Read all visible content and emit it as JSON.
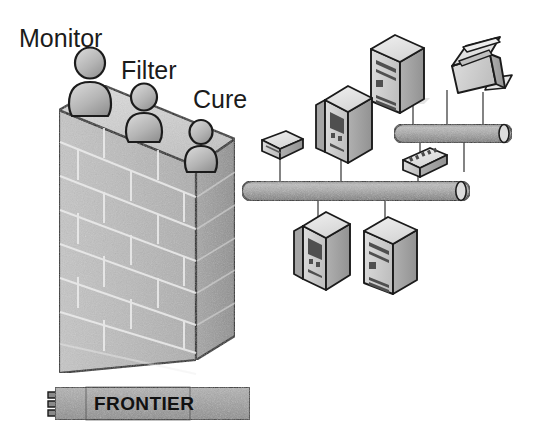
{
  "diagram": {
    "background_color": "#ffffff",
    "ink_color": "#1b1b1b"
  },
  "firewall": {
    "name": "brick-firewall",
    "brick_courses": 6,
    "face_color": "#b9b9b9",
    "top_color": "#d2d2d2",
    "side_color": "#9a9a9a",
    "mortar_color": "#e8e8e8",
    "outline_color": "#1b1b1b"
  },
  "guards": [
    {
      "label": "Monitor",
      "figure": "person-figure",
      "size": "large"
    },
    {
      "label": "Filter",
      "figure": "person-figure",
      "size": "medium"
    },
    {
      "label": "Cure",
      "figure": "person-figure",
      "size": "small"
    }
  ],
  "banner": {
    "label": "FRONTIER",
    "fill_color": "#9e9e9e",
    "text_color": "#111111"
  },
  "network": {
    "buses": [
      {
        "name": "upper-network-bus",
        "color": "#a8a8a8"
      },
      {
        "name": "lower-network-bus",
        "color": "#a8a8a8"
      }
    ],
    "devices": [
      {
        "name": "server-tower-top",
        "type": "server",
        "attached_to": "upper-network-bus"
      },
      {
        "name": "printer",
        "type": "printer",
        "attached_to": "upper-network-bus"
      },
      {
        "name": "hub-upper",
        "type": "hub",
        "attached_to": "upper-network-bus"
      },
      {
        "name": "modem-left",
        "type": "modem",
        "attached_to": "lower-network-bus"
      },
      {
        "name": "workstation-middle",
        "type": "workstation",
        "attached_to": "lower-network-bus"
      },
      {
        "name": "workstation-lower-left",
        "type": "workstation",
        "attached_to": "lower-network-bus"
      },
      {
        "name": "server-tower-lower",
        "type": "server",
        "attached_to": "lower-network-bus"
      }
    ],
    "device_colors": {
      "front": "#c9c9c9",
      "top": "#e2e2e2",
      "side": "#9d9d9d",
      "detail": "#5c5c5c",
      "outline": "#1b1b1b"
    }
  }
}
